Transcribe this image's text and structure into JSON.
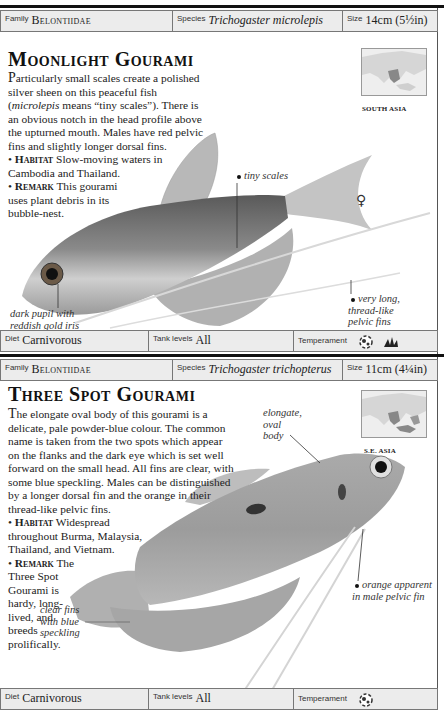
{
  "entries": [
    {
      "header": {
        "family_label": "Family",
        "family_value": "Belontiidae",
        "species_label": "Species",
        "species_value": "Trichogaster microlepis",
        "size_label": "Size",
        "size_value": "14cm (5½in)"
      },
      "title": "Moonlight Gourami",
      "description": {
        "dropcap": "P",
        "text_part1": "articularly small scales create a polished silver sheen on this peaceful fish (",
        "text_italic": "microlepis",
        "text_part2": " means “tiny scales”). There is an obvious notch in the head profile above the upturned mouth. Males have red pelvic fins and slightly longer dorsal fins.",
        "habitat_label": "Habitat",
        "habitat_text": " Slow-moving waters in Cambodia and Thailand.",
        "remark_label": "Remark",
        "remark_text": " This gourami uses plant debris in its bubble-nest."
      },
      "map": {
        "region_label": "SOUTH ASIA",
        "icon": "map-icon"
      },
      "callouts": [
        {
          "text": "tiny scales"
        },
        {
          "text": "dark pupil with reddish gold iris"
        },
        {
          "text": "very long, thread-like pelvic fins"
        }
      ],
      "sex_symbol": "♀",
      "footer": {
        "diet_label": "Diet",
        "diet_value": "Carnivorous",
        "tank_label": "Tank levels",
        "tank_value": "All",
        "temperament_label": "Temperament",
        "temperament_icons": [
          "peaceful-fish-icon",
          "plant-icon"
        ]
      }
    },
    {
      "header": {
        "family_label": "Family",
        "family_value": "Belontiidae",
        "species_label": "Species",
        "species_value": "Trichogaster trichopterus",
        "size_label": "Size",
        "size_value": "11cm (4¼in)"
      },
      "title": "Three Spot Gourami",
      "description": {
        "dropcap": "T",
        "text_part1": "he elongate oval body of this gourami is a delicate, pale powder-blue colour. The common name is taken from the two spots which appear on the flanks and the dark eye which is set well forward on the small head. All fins are clear, with some blue speckling. Males can be distinguished by a longer dorsal fin and the orange in their thread-like pelvic fins.",
        "habitat_label": "Habitat",
        "habitat_text": " Widespread throughout Burma, Malaysia, Thailand, and Vietnam.",
        "remark_label": "Remark",
        "remark_text_lines": [
          "The",
          "Three Spot",
          "Gourami is",
          "hardy, long-",
          "lived, and",
          "breeds",
          "prolifically."
        ]
      },
      "map": {
        "region_label": "S.E. ASIA",
        "icon": "map-icon"
      },
      "callouts": [
        {
          "text": "elongate, oval body"
        },
        {
          "text": "clear fins with blue speckling"
        },
        {
          "text": "orange apparent in male pelvic fin"
        }
      ],
      "footer": {
        "diet_label": "Diet",
        "diet_value": "Carnivorous",
        "tank_label": "Tank levels",
        "tank_value": "All",
        "temperament_label": "Temperament",
        "temperament_icons": [
          "peaceful-fish-icon"
        ]
      }
    }
  ]
}
